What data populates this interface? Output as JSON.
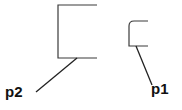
{
  "diagram": {
    "shapes": [
      {
        "id": "p2",
        "kind": "square-bracket",
        "corner": "sharp",
        "label": "p2"
      },
      {
        "id": "p1",
        "kind": "square-bracket",
        "corner": "rounded",
        "label": "p1"
      }
    ],
    "colors": {
      "stroke": "#3a3a3a",
      "label": "#111111",
      "background": "#ffffff"
    }
  }
}
